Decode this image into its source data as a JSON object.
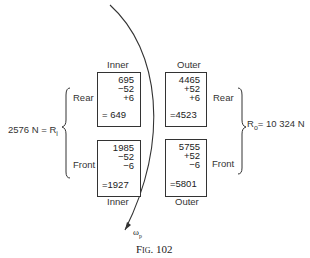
{
  "figure": {
    "caption": "Fig. 102",
    "left_total": "2576 N = R",
    "left_total_sub": "i",
    "right_total_prefix": "R",
    "right_total_sub": "o",
    "right_total_value": "= 10 324  N",
    "omega_label": "ω",
    "omega_sub": "p"
  },
  "boxes": {
    "inner_rear": {
      "column_label": "Inner",
      "row_label": "Rear",
      "lines": [
        "695",
        "−52",
        "+6"
      ],
      "result": "=  649"
    },
    "outer_rear": {
      "column_label": "Outer",
      "row_label": "Rear",
      "lines": [
        "4465",
        "+52",
        "+6"
      ],
      "result": "=4523"
    },
    "inner_front": {
      "column_label": "Inner",
      "row_label": "Front",
      "lines": [
        "1985",
        "−52",
        "−6"
      ],
      "result": "=1927"
    },
    "outer_front": {
      "column_label": "Outer",
      "row_label": "Front",
      "lines": [
        "5755",
        "+52",
        "−6"
      ],
      "result": "=5801"
    }
  },
  "colors": {
    "ink": "#222222",
    "background": "#ffffff"
  }
}
